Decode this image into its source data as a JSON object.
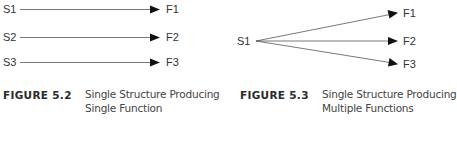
{
  "figure_left": {
    "sources": [
      "S1",
      "S2",
      "S3"
    ],
    "targets": [
      "F1",
      "F2",
      "F3"
    ],
    "caption_number": "FIGURE 5.2",
    "caption_line1": "Single Structure Producing",
    "caption_line2": "Single Function"
  },
  "figure_right": {
    "source": "S1",
    "targets": [
      "F1",
      "F2",
      "F3"
    ],
    "caption_number": "FIGURE 5.3",
    "caption_line1": "Single Structure Producing",
    "caption_line2": "Multiple Functions"
  },
  "colors": {
    "line": "#555555",
    "arrowhead": "#111111",
    "text": "#333333"
  }
}
